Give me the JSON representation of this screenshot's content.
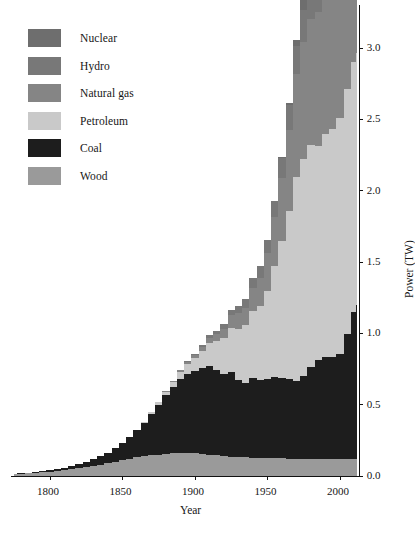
{
  "chart_data": {
    "type": "area",
    "stacked": true,
    "title": "",
    "xlabel": "Year",
    "ylabel": "Power (TW)",
    "xlim": [
      1775,
      2013
    ],
    "ylim": [
      0.0,
      3.3
    ],
    "xticks": [
      1800,
      1850,
      1900,
      1950,
      2000
    ],
    "xtick_labels": [
      "1800",
      "1850",
      "1900",
      "1950",
      "2000"
    ],
    "yticks": [
      0.0,
      0.5,
      1.0,
      1.5,
      2.0,
      2.5,
      3.0
    ],
    "ytick_labels": [
      "0.0",
      "0.5",
      "1.0",
      "1.5",
      "2.0",
      "2.5",
      "3.0"
    ],
    "grid": false,
    "legend_position": "upper-left",
    "x": [
      1775,
      1780,
      1785,
      1790,
      1795,
      1800,
      1805,
      1810,
      1815,
      1820,
      1825,
      1830,
      1835,
      1840,
      1845,
      1850,
      1855,
      1860,
      1865,
      1870,
      1875,
      1880,
      1885,
      1890,
      1895,
      1900,
      1905,
      1910,
      1915,
      1920,
      1925,
      1930,
      1935,
      1940,
      1945,
      1950,
      1955,
      1960,
      1965,
      1970,
      1975,
      1980,
      1985,
      1990,
      1995,
      2000,
      2005,
      2010,
      2012
    ],
    "series": [
      {
        "name": "Wood",
        "color": "#9a9a9a",
        "values": [
          0.012,
          0.015,
          0.018,
          0.022,
          0.026,
          0.03,
          0.035,
          0.041,
          0.047,
          0.054,
          0.062,
          0.071,
          0.08,
          0.09,
          0.1,
          0.11,
          0.12,
          0.13,
          0.138,
          0.145,
          0.15,
          0.155,
          0.158,
          0.16,
          0.16,
          0.158,
          0.155,
          0.15,
          0.145,
          0.14,
          0.136,
          0.132,
          0.13,
          0.128,
          0.126,
          0.125,
          0.124,
          0.123,
          0.122,
          0.122,
          0.122,
          0.122,
          0.122,
          0.122,
          0.122,
          0.122,
          0.122,
          0.122,
          0.122
        ]
      },
      {
        "name": "Coal",
        "color": "#1d1d1d",
        "values": [
          0.002,
          0.003,
          0.004,
          0.005,
          0.007,
          0.009,
          0.012,
          0.016,
          0.021,
          0.027,
          0.035,
          0.045,
          0.058,
          0.074,
          0.094,
          0.118,
          0.15,
          0.19,
          0.235,
          0.29,
          0.35,
          0.41,
          0.465,
          0.52,
          0.555,
          0.58,
          0.6,
          0.62,
          0.6,
          0.575,
          0.59,
          0.54,
          0.525,
          0.56,
          0.545,
          0.555,
          0.57,
          0.565,
          0.555,
          0.545,
          0.58,
          0.64,
          0.69,
          0.715,
          0.71,
          0.73,
          0.87,
          1.03,
          1.08
        ]
      },
      {
        "name": "Petroleum",
        "color": "#c9c9c9",
        "values": [
          0.0,
          0.0,
          0.0,
          0.0,
          0.0,
          0.0,
          0.0,
          0.0,
          0.0,
          0.0,
          0.0,
          0.0,
          0.0,
          0.0,
          0.0,
          0.0,
          0.002,
          0.004,
          0.007,
          0.012,
          0.018,
          0.026,
          0.036,
          0.05,
          0.068,
          0.09,
          0.12,
          0.16,
          0.2,
          0.25,
          0.31,
          0.36,
          0.4,
          0.47,
          0.52,
          0.62,
          0.78,
          0.96,
          1.18,
          1.43,
          1.52,
          1.56,
          1.5,
          1.56,
          1.6,
          1.66,
          1.72,
          1.75,
          1.76
        ]
      },
      {
        "name": "Natural gas",
        "color": "#858585",
        "values": [
          0.0,
          0.0,
          0.0,
          0.0,
          0.0,
          0.0,
          0.0,
          0.0,
          0.0,
          0.0,
          0.0,
          0.0,
          0.0,
          0.0,
          0.0,
          0.0,
          0.0,
          0.0,
          0.0,
          0.001,
          0.002,
          0.004,
          0.007,
          0.011,
          0.016,
          0.022,
          0.03,
          0.04,
          0.052,
          0.068,
          0.09,
          0.11,
          0.125,
          0.16,
          0.2,
          0.26,
          0.34,
          0.44,
          0.57,
          0.72,
          0.82,
          0.88,
          0.94,
          1.04,
          1.11,
          1.19,
          1.28,
          1.4,
          1.44
        ]
      },
      {
        "name": "Hydro",
        "color": "#787878",
        "values": [
          0.0,
          0.0,
          0.0,
          0.0,
          0.0,
          0.0,
          0.0,
          0.0,
          0.0,
          0.0,
          0.0,
          0.0,
          0.0,
          0.0,
          0.0,
          0.0,
          0.0,
          0.0,
          0.0,
          0.0,
          0.0,
          0.0,
          0.001,
          0.002,
          0.004,
          0.007,
          0.011,
          0.016,
          0.022,
          0.03,
          0.04,
          0.05,
          0.058,
          0.07,
          0.08,
          0.095,
          0.115,
          0.14,
          0.17,
          0.2,
          0.225,
          0.25,
          0.28,
          0.3,
          0.32,
          0.34,
          0.37,
          0.41,
          0.42
        ]
      },
      {
        "name": "Nuclear",
        "color": "#6e6e6e",
        "values": [
          0.0,
          0.0,
          0.0,
          0.0,
          0.0,
          0.0,
          0.0,
          0.0,
          0.0,
          0.0,
          0.0,
          0.0,
          0.0,
          0.0,
          0.0,
          0.0,
          0.0,
          0.0,
          0.0,
          0.0,
          0.0,
          0.0,
          0.0,
          0.0,
          0.0,
          0.0,
          0.0,
          0.0,
          0.0,
          0.0,
          0.0,
          0.0,
          0.0,
          0.0,
          0.0,
          0.0,
          0.002,
          0.006,
          0.015,
          0.04,
          0.09,
          0.15,
          0.23,
          0.28,
          0.3,
          0.31,
          0.315,
          0.3,
          0.29
        ]
      }
    ]
  },
  "legend": {
    "items": [
      {
        "label": "Nuclear",
        "color": "#6e6e6e"
      },
      {
        "label": "Hydro",
        "color": "#787878"
      },
      {
        "label": "Natural gas",
        "color": "#858585"
      },
      {
        "label": "Petroleum",
        "color": "#c9c9c9"
      },
      {
        "label": "Coal",
        "color": "#1d1d1d"
      },
      {
        "label": "Wood",
        "color": "#9a9a9a"
      }
    ]
  },
  "axes": {
    "x_title": "Year",
    "y_title": "Power (TW)"
  }
}
